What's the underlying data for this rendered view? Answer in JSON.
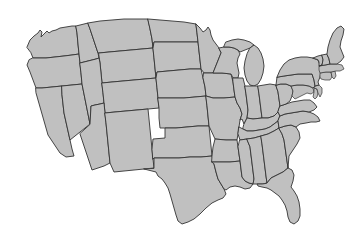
{
  "map": {
    "title": "United States Contiguous States Map",
    "projection": "albers-usa",
    "background_color": "#ffffff",
    "state_fill_color": "#c0c0c0",
    "state_border_color": "#333333",
    "border_width_px": 0.9,
    "region_label": "Contiguous United States",
    "state_count": "48",
    "states": [
      {
        "code": "WA",
        "name": "Washington"
      },
      {
        "code": "OR",
        "name": "Oregon"
      },
      {
        "code": "CA",
        "name": "California"
      },
      {
        "code": "NV",
        "name": "Nevada"
      },
      {
        "code": "ID",
        "name": "Idaho"
      },
      {
        "code": "MT",
        "name": "Montana"
      },
      {
        "code": "WY",
        "name": "Wyoming"
      },
      {
        "code": "UT",
        "name": "Utah"
      },
      {
        "code": "AZ",
        "name": "Arizona"
      },
      {
        "code": "CO",
        "name": "Colorado"
      },
      {
        "code": "NM",
        "name": "New Mexico"
      },
      {
        "code": "ND",
        "name": "North Dakota"
      },
      {
        "code": "SD",
        "name": "South Dakota"
      },
      {
        "code": "NE",
        "name": "Nebraska"
      },
      {
        "code": "KS",
        "name": "Kansas"
      },
      {
        "code": "OK",
        "name": "Oklahoma"
      },
      {
        "code": "TX",
        "name": "Texas"
      },
      {
        "code": "MN",
        "name": "Minnesota"
      },
      {
        "code": "IA",
        "name": "Iowa"
      },
      {
        "code": "MO",
        "name": "Missouri"
      },
      {
        "code": "AR",
        "name": "Arkansas"
      },
      {
        "code": "LA",
        "name": "Louisiana"
      },
      {
        "code": "WI",
        "name": "Wisconsin"
      },
      {
        "code": "IL",
        "name": "Illinois"
      },
      {
        "code": "MI",
        "name": "Michigan"
      },
      {
        "code": "IN",
        "name": "Indiana"
      },
      {
        "code": "OH",
        "name": "Ohio"
      },
      {
        "code": "KY",
        "name": "Kentucky"
      },
      {
        "code": "TN",
        "name": "Tennessee"
      },
      {
        "code": "MS",
        "name": "Mississippi"
      },
      {
        "code": "AL",
        "name": "Alabama"
      },
      {
        "code": "GA",
        "name": "Georgia"
      },
      {
        "code": "FL",
        "name": "Florida"
      },
      {
        "code": "SC",
        "name": "South Carolina"
      },
      {
        "code": "NC",
        "name": "North Carolina"
      },
      {
        "code": "VA",
        "name": "Virginia"
      },
      {
        "code": "WV",
        "name": "West Virginia"
      },
      {
        "code": "MD",
        "name": "Maryland"
      },
      {
        "code": "DE",
        "name": "Delaware"
      },
      {
        "code": "PA",
        "name": "Pennsylvania"
      },
      {
        "code": "NJ",
        "name": "New Jersey"
      },
      {
        "code": "NY",
        "name": "New York"
      },
      {
        "code": "CT",
        "name": "Connecticut"
      },
      {
        "code": "RI",
        "name": "Rhode Island"
      },
      {
        "code": "MA",
        "name": "Massachusetts"
      },
      {
        "code": "VT",
        "name": "Vermont"
      },
      {
        "code": "NH",
        "name": "New Hampshire"
      },
      {
        "code": "ME",
        "name": "Maine"
      }
    ]
  }
}
